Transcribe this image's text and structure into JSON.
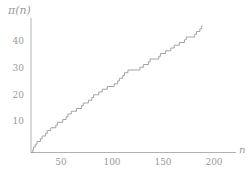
{
  "figure": {
    "ylabel": "π(n)",
    "xlabel": "n",
    "axis_color": "#9d9d9d",
    "curve_color": "#9a9a9a",
    "label_color": "#9a9a9a",
    "background": "#ffffff"
  },
  "axes": {
    "y_ticks": [
      {
        "value": 10,
        "label": "10"
      },
      {
        "value": 20,
        "label": "20"
      },
      {
        "value": 30,
        "label": "30"
      },
      {
        "value": 40,
        "label": "40"
      }
    ],
    "x_ticks": [
      {
        "value": 50,
        "label": "50"
      },
      {
        "value": 100,
        "label": "100"
      },
      {
        "value": 150,
        "label": "150"
      },
      {
        "value": 200,
        "label": "200"
      }
    ]
  },
  "chart_data": {
    "type": "line",
    "title": "",
    "subtitle": "",
    "xlabel": "n",
    "ylabel": "π(n)",
    "xlim": [
      0,
      210
    ],
    "ylim": [
      0,
      48
    ],
    "grid": false,
    "legend": null,
    "step": "post",
    "xticks": [
      50,
      100,
      150,
      200
    ],
    "yticks": [
      10,
      20,
      30,
      40
    ],
    "series": [
      {
        "name": "pi(n)",
        "color": "#9a9a9a",
        "jump_points": [
          2,
          3,
          5,
          7,
          11,
          13,
          17,
          19,
          23,
          29,
          31,
          37,
          41,
          43,
          47,
          53,
          59,
          61,
          67,
          71,
          73,
          79,
          83,
          89,
          97,
          101,
          103,
          107,
          109,
          113,
          127,
          131,
          137,
          139,
          149,
          151,
          157,
          163,
          167,
          173,
          179,
          181,
          191,
          193,
          197,
          199
        ],
        "x": [
          0,
          10,
          20,
          30,
          40,
          50,
          60,
          70,
          80,
          90,
          100,
          110,
          120,
          130,
          140,
          150,
          160,
          170,
          180,
          190,
          200
        ],
        "values": [
          0,
          4,
          8,
          10,
          12,
          15,
          17,
          19,
          22,
          24,
          25,
          29,
          30,
          31,
          34,
          35,
          37,
          39,
          41,
          42,
          46
        ]
      }
    ]
  }
}
